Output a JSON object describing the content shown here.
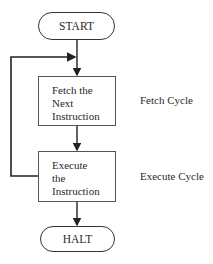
{
  "diagram": {
    "start": {
      "label": "START"
    },
    "fetch": {
      "lines": [
        "Fetch the",
        "Next",
        "Instruction"
      ]
    },
    "execute": {
      "lines": [
        "Execute",
        "the",
        "Instruction"
      ]
    },
    "halt": {
      "label": "HALT"
    },
    "annotations": {
      "fetch_cycle": "Fetch Cycle",
      "execute_cycle": "Execute Cycle"
    },
    "colors": {
      "line": "#222222",
      "box_border": "#555555",
      "text": "#2a2a2a"
    }
  }
}
